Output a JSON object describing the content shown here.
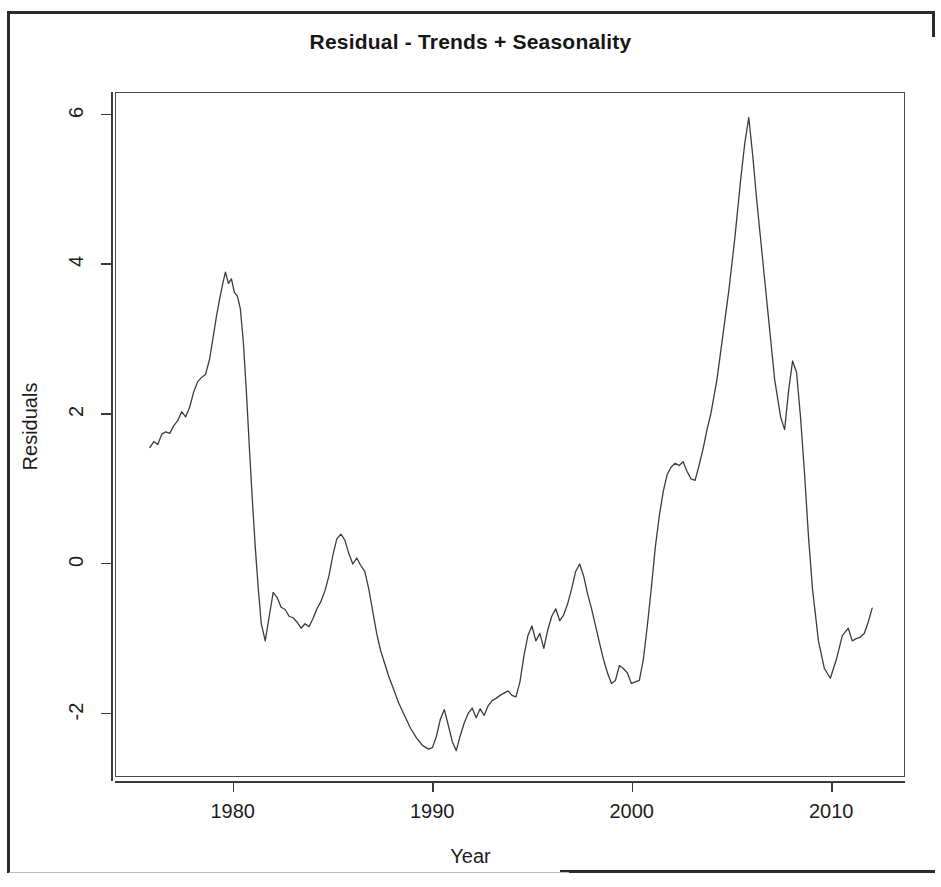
{
  "chart_data": {
    "type": "line",
    "title": "Residual - Trends + Seasonality",
    "xlabel": "Year",
    "ylabel": "Residuals",
    "xlim": [
      1974.1,
      2013.7
    ],
    "ylim": [
      -2.86,
      6.29
    ],
    "xticks": [
      1980,
      1990,
      2000,
      2010
    ],
    "xticklabels": [
      "1980",
      "1990",
      "2000",
      "2010"
    ],
    "yticks": [
      -2,
      0,
      2,
      4,
      6
    ],
    "yticklabels": [
      "-2",
      "0",
      "2",
      "4",
      "6"
    ],
    "grid": false,
    "legend": null,
    "line_color": "#3c3c3c",
    "series": [
      {
        "name": "Residuals",
        "x": [
          1975.8,
          1976.0,
          1976.2,
          1976.4,
          1976.6,
          1976.8,
          1977.0,
          1977.2,
          1977.4,
          1977.6,
          1977.8,
          1978.0,
          1978.2,
          1978.4,
          1978.6,
          1978.8,
          1979.0,
          1979.15,
          1979.3,
          1979.45,
          1979.6,
          1979.75,
          1979.9,
          1980.05,
          1980.2,
          1980.35,
          1980.5,
          1980.65,
          1980.8,
          1980.95,
          1981.1,
          1981.25,
          1981.4,
          1981.6,
          1981.8,
          1982.0,
          1982.2,
          1982.4,
          1982.6,
          1982.8,
          1983.0,
          1983.2,
          1983.4,
          1983.6,
          1983.8,
          1984.0,
          1984.2,
          1984.4,
          1984.6,
          1984.8,
          1985.0,
          1985.2,
          1985.4,
          1985.6,
          1985.8,
          1986.0,
          1986.2,
          1986.4,
          1986.6,
          1986.8,
          1987.0,
          1987.2,
          1987.4,
          1987.6,
          1987.8,
          1988.0,
          1988.3,
          1988.6,
          1988.9,
          1989.2,
          1989.5,
          1989.8,
          1990.0,
          1990.2,
          1990.4,
          1990.6,
          1990.8,
          1991.0,
          1991.2,
          1991.4,
          1991.6,
          1991.8,
          1992.0,
          1992.2,
          1992.4,
          1992.6,
          1992.8,
          1993.0,
          1993.2,
          1993.4,
          1993.6,
          1993.8,
          1994.0,
          1994.2,
          1994.4,
          1994.6,
          1994.8,
          1995.0,
          1995.2,
          1995.4,
          1995.6,
          1995.8,
          1996.0,
          1996.2,
          1996.4,
          1996.6,
          1996.8,
          1997.0,
          1997.2,
          1997.4,
          1997.6,
          1997.8,
          1998.0,
          1998.2,
          1998.4,
          1998.6,
          1998.8,
          1999.0,
          1999.2,
          1999.4,
          1999.6,
          1999.8,
          2000.0,
          2000.2,
          2000.4,
          2000.6,
          2000.8,
          2001.0,
          2001.2,
          2001.4,
          2001.6,
          2001.8,
          2002.0,
          2002.2,
          2002.4,
          2002.6,
          2002.8,
          2003.0,
          2003.2,
          2003.4,
          2003.6,
          2003.8,
          2004.0,
          2004.3,
          2004.6,
          2004.9,
          2005.2,
          2005.5,
          2005.7,
          2005.9,
          2006.1,
          2006.3,
          2006.6,
          2006.9,
          2007.2,
          2007.5,
          2007.7,
          2007.9,
          2008.1,
          2008.3,
          2008.5,
          2008.7,
          2008.9,
          2009.1,
          2009.4,
          2009.7,
          2010.0,
          2010.3,
          2010.6,
          2010.9,
          2011.1,
          2011.3,
          2011.5,
          2011.7,
          2011.9,
          2012.1
        ],
        "y": [
          1.54,
          1.62,
          1.58,
          1.72,
          1.75,
          1.73,
          1.83,
          1.9,
          2.02,
          1.95,
          2.08,
          2.28,
          2.42,
          2.48,
          2.52,
          2.72,
          3.05,
          3.3,
          3.52,
          3.72,
          3.89,
          3.74,
          3.8,
          3.62,
          3.57,
          3.4,
          2.95,
          2.3,
          1.55,
          0.85,
          0.2,
          -0.35,
          -0.82,
          -1.05,
          -0.72,
          -0.4,
          -0.47,
          -0.6,
          -0.63,
          -0.72,
          -0.74,
          -0.8,
          -0.88,
          -0.82,
          -0.86,
          -0.75,
          -0.62,
          -0.52,
          -0.38,
          -0.18,
          0.1,
          0.32,
          0.38,
          0.3,
          0.12,
          -0.02,
          0.06,
          -0.04,
          -0.12,
          -0.35,
          -0.65,
          -0.95,
          -1.18,
          -1.35,
          -1.52,
          -1.66,
          -1.88,
          -2.05,
          -2.22,
          -2.35,
          -2.45,
          -2.5,
          -2.48,
          -2.33,
          -2.1,
          -1.97,
          -2.18,
          -2.4,
          -2.52,
          -2.32,
          -2.15,
          -2.02,
          -1.95,
          -2.08,
          -1.96,
          -2.05,
          -1.92,
          -1.85,
          -1.82,
          -1.78,
          -1.75,
          -1.72,
          -1.78,
          -1.8,
          -1.6,
          -1.25,
          -0.98,
          -0.85,
          -1.05,
          -0.95,
          -1.15,
          -0.9,
          -0.72,
          -0.62,
          -0.78,
          -0.7,
          -0.55,
          -0.35,
          -0.12,
          -0.02,
          -0.18,
          -0.42,
          -0.62,
          -0.85,
          -1.08,
          -1.3,
          -1.48,
          -1.62,
          -1.58,
          -1.38,
          -1.42,
          -1.48,
          -1.62,
          -1.6,
          -1.58,
          -1.3,
          -0.85,
          -0.35,
          0.2,
          0.62,
          0.95,
          1.18,
          1.28,
          1.33,
          1.3,
          1.35,
          1.22,
          1.12,
          1.1,
          1.3,
          1.52,
          1.78,
          2.0,
          2.45,
          3.05,
          3.65,
          4.35,
          5.15,
          5.62,
          5.96,
          5.45,
          4.85,
          4.05,
          3.25,
          2.45,
          1.95,
          1.78,
          2.3,
          2.7,
          2.55,
          1.95,
          1.2,
          0.35,
          -0.35,
          -1.05,
          -1.42,
          -1.55,
          -1.3,
          -0.98,
          -0.88,
          -1.05,
          -1.02,
          -1.0,
          -0.95,
          -0.8,
          -0.61
        ]
      }
    ]
  },
  "axes": {
    "x_title": "Year",
    "y_title": "Residuals"
  }
}
